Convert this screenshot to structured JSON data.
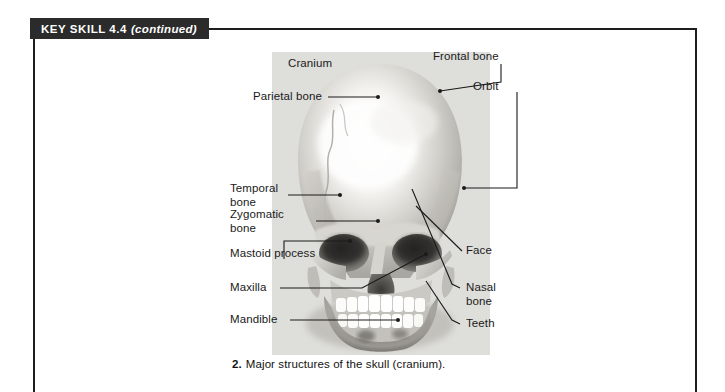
{
  "banner": {
    "title": "KEY SKILL 4.4",
    "continued": "(continued)"
  },
  "figure": {
    "caption_number": "2.",
    "caption_text": "Major structures of the skull (cranium).",
    "image_alt": "skull-front-view-photograph",
    "labels": [
      {
        "id": "cranium",
        "text": "Cranium"
      },
      {
        "id": "frontal-bone",
        "text": "Frontal bone"
      },
      {
        "id": "orbit",
        "text": "Orbit"
      },
      {
        "id": "parietal-bone",
        "text": "Parietal bone"
      },
      {
        "id": "temporal-bone",
        "text": "Temporal\nbone"
      },
      {
        "id": "zygomatic-bone",
        "text": "Zygomatic\nbone"
      },
      {
        "id": "mastoid-process",
        "text": "Mastoid process"
      },
      {
        "id": "maxilla",
        "text": "Maxilla"
      },
      {
        "id": "mandible",
        "text": "Mandible"
      },
      {
        "id": "face",
        "text": "Face"
      },
      {
        "id": "nasal-bone",
        "text": "Nasal\nbone"
      },
      {
        "id": "teeth",
        "text": "Teeth"
      }
    ]
  },
  "colors": {
    "banner_background": "#2b2b2b",
    "banner_text": "#ffffff",
    "frame_rule": "#1d1d1d",
    "photo_background": "#dededa",
    "label_text": "#1a1a1a",
    "leader_line": "#1a1a1a",
    "page_background": "#ffffff"
  }
}
